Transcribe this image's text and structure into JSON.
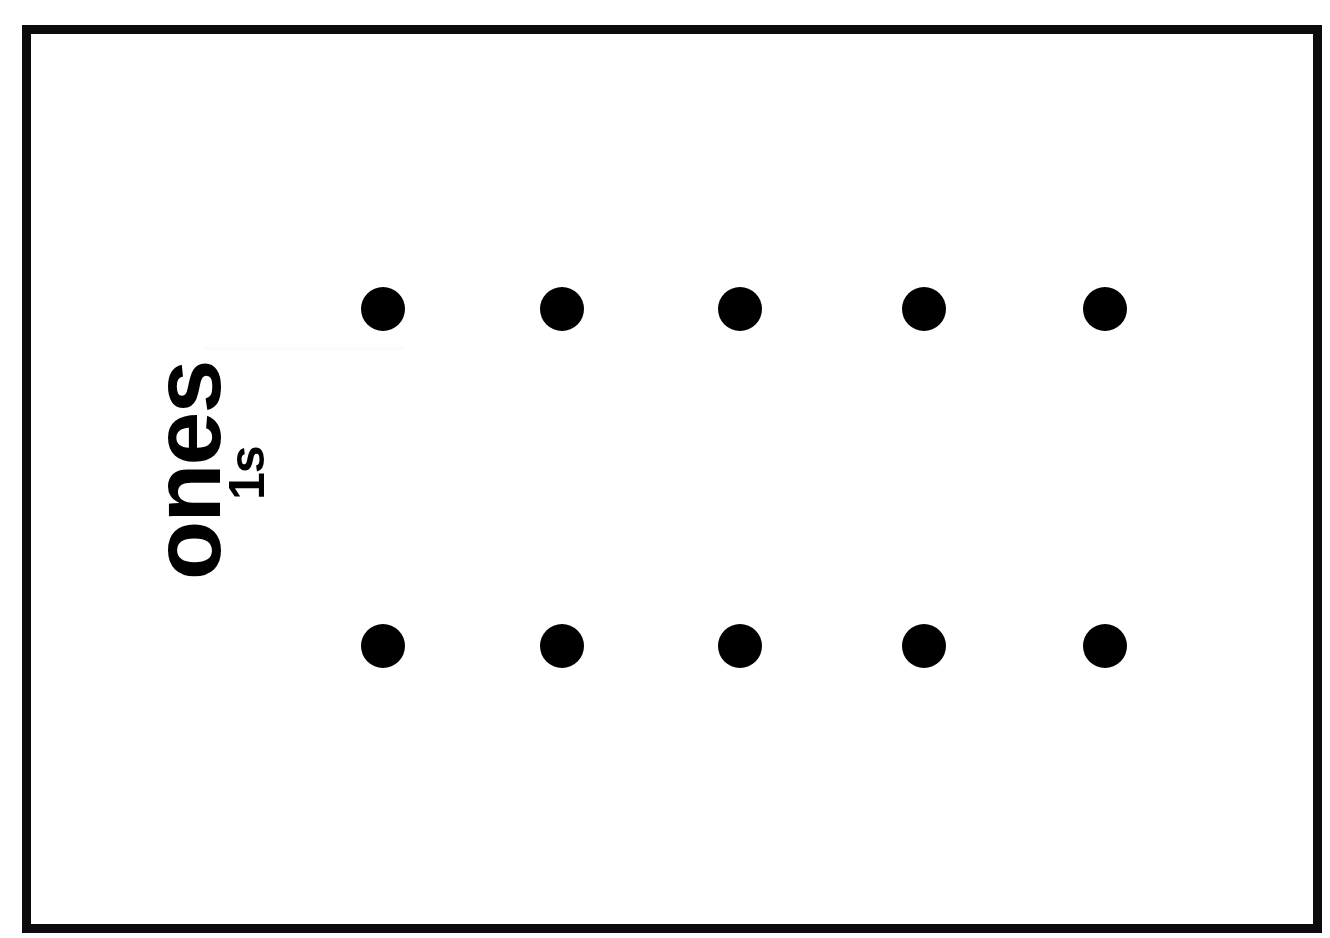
{
  "card": {
    "title": "ones place value dot card",
    "frame_color": "#0b0b0b",
    "background_color": "#ffffff",
    "dot_color": "#000000"
  },
  "label": {
    "primary": "ones",
    "secondary": "1s",
    "orientation": "rotated-90-ccw"
  },
  "chart_data": {
    "type": "scatter",
    "title": "ones",
    "subtitle": "1s",
    "xlabel": "",
    "ylabel": "",
    "rows": 2,
    "columns": 5,
    "total_dots": 10,
    "dot_diameter": 44,
    "x": [
      383,
      562,
      740,
      924,
      1105
    ],
    "y": [
      309,
      646
    ],
    "points": [
      {
        "x": 383,
        "y": 309
      },
      {
        "x": 562,
        "y": 309
      },
      {
        "x": 740,
        "y": 309
      },
      {
        "x": 924,
        "y": 309
      },
      {
        "x": 1105,
        "y": 309
      },
      {
        "x": 383,
        "y": 646
      },
      {
        "x": 562,
        "y": 646
      },
      {
        "x": 740,
        "y": 646
      },
      {
        "x": 924,
        "y": 646
      },
      {
        "x": 1105,
        "y": 646
      }
    ],
    "series": [
      {
        "name": "top row",
        "values": [
          1,
          1,
          1,
          1,
          1
        ]
      },
      {
        "name": "bottom row",
        "values": [
          1,
          1,
          1,
          1,
          1
        ]
      }
    ],
    "grid": false,
    "legend": "none"
  }
}
